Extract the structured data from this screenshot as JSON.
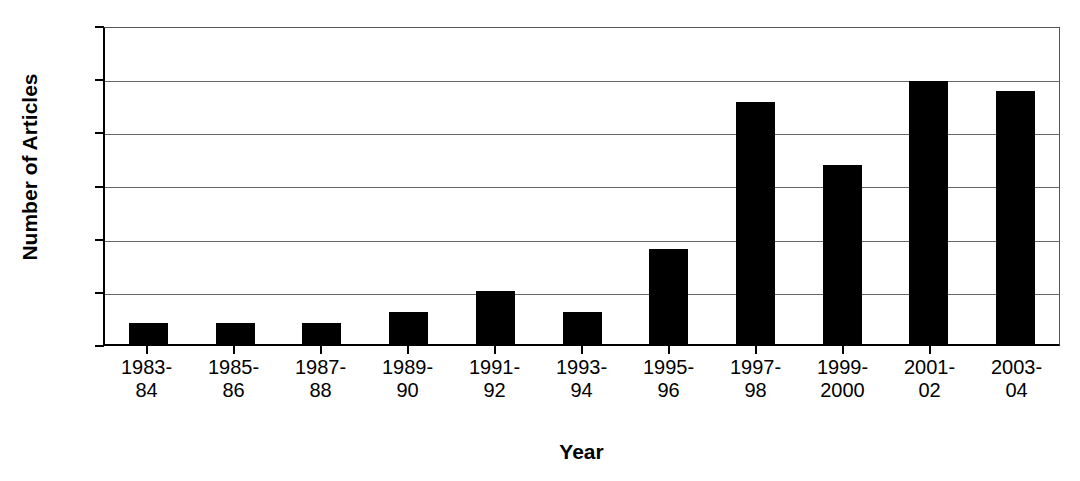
{
  "chart_data": {
    "type": "bar",
    "title": "",
    "xlabel": "Year",
    "ylabel": "Number of Articles",
    "categories": [
      "1983-\n84",
      "1985-\n86",
      "1987-\n88",
      "1989-\n90",
      "1991-\n92",
      "1993-\n94",
      "1995-\n96",
      "1997-\n98",
      "1999-\n2000",
      "2001-\n02",
      "2003-\n04"
    ],
    "category_lines": [
      [
        "1983-",
        "84"
      ],
      [
        "1985-",
        "86"
      ],
      [
        "1987-",
        "88"
      ],
      [
        "1989-",
        "90"
      ],
      [
        "1991-",
        "92"
      ],
      [
        "1993-",
        "94"
      ],
      [
        "1995-",
        "96"
      ],
      [
        "1997-",
        "98"
      ],
      [
        "1999-",
        "2000"
      ],
      [
        "2001-",
        "02"
      ],
      [
        "2003-",
        "04"
      ]
    ],
    "values": [
      2,
      2,
      2,
      3,
      5,
      3,
      9,
      23,
      17,
      25,
      24
    ],
    "ylim": [
      0,
      30
    ],
    "ytick_values": [
      0,
      5,
      10,
      15,
      20,
      25,
      30
    ],
    "ytick_labels": [
      "0",
      "5",
      "10",
      "15",
      "20",
      "25",
      "30"
    ],
    "grid": true,
    "grid_axis": "y",
    "legend": false,
    "legend_position": "none",
    "bar_color": "#000000",
    "plot_background": "#FFFFFF",
    "axis_color": "#000000",
    "gridline_color": "#666666"
  }
}
